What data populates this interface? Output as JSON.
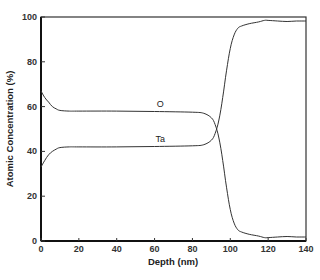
{
  "chart_data": {
    "type": "line",
    "title": "",
    "xlabel": "Depth (nm)",
    "ylabel": "Atomic Concentration (%)",
    "xlim": [
      0,
      140
    ],
    "ylim": [
      0,
      100
    ],
    "xticks": [
      0,
      20,
      40,
      60,
      80,
      100,
      120,
      140
    ],
    "yticks": [
      0,
      20,
      40,
      60,
      80,
      100
    ],
    "grid": false,
    "legend": "inline labels",
    "series": [
      {
        "name": "O",
        "label_pos": [
          63,
          60
        ],
        "x": [
          0,
          2,
          4,
          6,
          8,
          10,
          15,
          20,
          40,
          60,
          80,
          86,
          90,
          92,
          94,
          96,
          98,
          100,
          102,
          104,
          106,
          110,
          115,
          118,
          120,
          125,
          130,
          135,
          140
        ],
        "y": [
          67,
          64,
          62,
          60,
          59,
          58.3,
          58,
          58,
          58,
          57.8,
          57.5,
          57,
          55,
          52,
          46,
          36,
          24,
          14,
          8,
          5,
          4,
          3,
          2.2,
          1.5,
          1.5,
          1.8,
          2,
          1.8,
          1.8
        ]
      },
      {
        "name": "Ta",
        "label_pos": [
          63,
          44
        ],
        "x": [
          0,
          2,
          4,
          6,
          8,
          10,
          15,
          20,
          40,
          60,
          80,
          86,
          90,
          92,
          94,
          96,
          98,
          100,
          102,
          104,
          106,
          110,
          115,
          118,
          120,
          125,
          130,
          135,
          140
        ],
        "y": [
          33,
          36,
          38.5,
          40,
          41,
          41.7,
          42,
          42,
          42,
          42.2,
          42.5,
          43,
          45,
          48,
          54,
          64,
          76,
          86,
          92,
          95,
          96,
          97,
          97.8,
          98.5,
          98.5,
          98.2,
          98,
          98.2,
          98.2
        ]
      }
    ]
  }
}
